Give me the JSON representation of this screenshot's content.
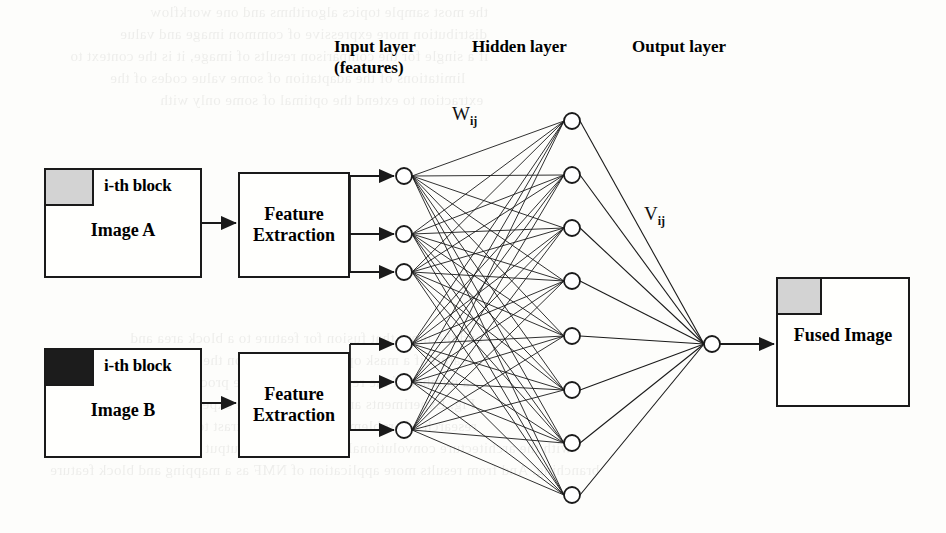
{
  "figure": {
    "type": "neural-network-diagram"
  },
  "captions": {
    "input_layer": "Input layer\n(features)",
    "hidden_layer": "Hidden layer",
    "output_layer": "Output layer"
  },
  "weights": {
    "input_to_hidden": "W",
    "input_to_hidden_sub": "ij",
    "hidden_to_output": "V",
    "hidden_to_output_sub": "ij"
  },
  "sources": [
    {
      "id": "image-a",
      "block_label": "i-th block",
      "name": "Image A",
      "block_color": "#d3d3d3",
      "block_tone": "light"
    },
    {
      "id": "image-b",
      "block_label": "i-th block",
      "name": "Image B",
      "block_color": "#1c1c1c",
      "block_tone": "dark"
    }
  ],
  "processors": [
    {
      "id": "fe-a",
      "label": "Feature\nExtraction"
    },
    {
      "id": "fe-b",
      "label": "Feature\nExtraction"
    }
  ],
  "result": {
    "id": "fused-image",
    "name": "Fused Image",
    "block_color": "#d3d3d3"
  },
  "network": {
    "input_nodes": 6,
    "hidden_nodes": 8,
    "output_nodes": 1,
    "node_radius": 8,
    "input_x": 404,
    "hidden_x": 572,
    "output_x": 712,
    "input_y": [
      176,
      234,
      272,
      344,
      382,
      430
    ],
    "hidden_y": [
      121,
      175,
      228,
      281,
      336,
      390,
      443,
      495
    ],
    "output_y": [
      344
    ],
    "stroke_color": "#1a1a1a",
    "node_fill": "#ffffff"
  },
  "ghost_text": [
    {
      "text": "the most sample topics algorithms and one workflow",
      "x": 150,
      "y": 4,
      "size": 15
    },
    {
      "text": "distribution more expressive of common image and value",
      "x": 120,
      "y": 26,
      "size": 15
    },
    {
      "text": "if a single for the comparison results of image, it is the context to",
      "x": 70,
      "y": 48,
      "size": 15
    },
    {
      "text": "limitations of the adaptation of some value codes of the",
      "x": 110,
      "y": 70,
      "size": 15
    },
    {
      "text": "extraction to extend the optimal of some only with",
      "x": 160,
      "y": 92,
      "size": 15
    },
    {
      "text": "and the input that fusion for feature to a block area and",
      "x": 130,
      "y": 330,
      "size": 15
    },
    {
      "text": "feature if a mask optimal and common the available nodes",
      "x": 100,
      "y": 352,
      "size": 15
    },
    {
      "text": "a number of the representation of the processing a block",
      "x": 110,
      "y": 374,
      "size": 15
    },
    {
      "text": "Fig. Experiments and results with the experimental common",
      "x": 90,
      "y": 396,
      "size": 15
    },
    {
      "text": "research of problem has a higher contrast to the image result",
      "x": 90,
      "y": 418,
      "size": 15
    },
    {
      "text": "with the architecture convolutional probability the output of two minimal image",
      "x": 60,
      "y": 440,
      "size": 15
    },
    {
      "text": "branching. And from results more application of NMF as a mapping and block feature",
      "x": 50,
      "y": 462,
      "size": 15
    }
  ]
}
